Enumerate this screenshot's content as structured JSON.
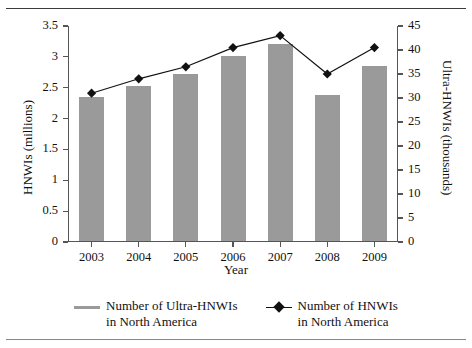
{
  "chart_data": {
    "type": "bar",
    "title": "",
    "subtitle": "",
    "xlabel": "Year",
    "ylabel": "HNWIs (millions)",
    "y2label": "Ultra-HNWIs (thousands)",
    "categories": [
      "2003",
      "2004",
      "2005",
      "2006",
      "2007",
      "2008",
      "2009"
    ],
    "ylim": [
      0,
      3.5
    ],
    "y2lim": [
      0,
      45
    ],
    "yticks": [
      "0",
      "0.5",
      "1",
      "1.5",
      "2",
      "2.5",
      "3",
      "3.5"
    ],
    "ytick_values": [
      0,
      0.5,
      1,
      1.5,
      2,
      2.5,
      3,
      3.5
    ],
    "y2ticks": [
      "0",
      "5",
      "10",
      "15",
      "20",
      "25",
      "30",
      "35",
      "40",
      "45"
    ],
    "y2tick_values": [
      0,
      5,
      10,
      15,
      20,
      25,
      30,
      35,
      40,
      45
    ],
    "grid": false,
    "legend_position": "bottom",
    "series": [
      {
        "name": "Number of Ultra-HNWIs\nin North America",
        "type": "bar",
        "axis": "left",
        "color": "#9a9a9a",
        "values": [
          2.33,
          2.51,
          2.71,
          3.0,
          3.2,
          2.37,
          2.83
        ]
      },
      {
        "name": "Number of HNWIs\nin North America",
        "type": "line",
        "axis": "right",
        "color": "#111111",
        "marker": "diamond",
        "values": [
          31.0,
          34.0,
          36.5,
          40.5,
          43.0,
          35.0,
          40.5
        ]
      }
    ]
  },
  "legend": {
    "items": [
      {
        "label": "Number of Ultra-HNWIs\nin North America",
        "marker": "gray-line"
      },
      {
        "label": "Number of HNWIs\nin North America",
        "marker": "black-line-diamond"
      }
    ]
  }
}
